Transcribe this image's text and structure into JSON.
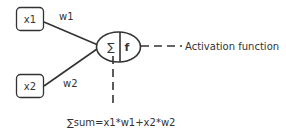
{
  "diagram": {
    "inputs": [
      {
        "label": "x1",
        "weight": "w1"
      },
      {
        "label": "x2",
        "weight": "w2"
      }
    ],
    "neuron": {
      "sum_symbol": "∑",
      "activation_symbol": "f"
    },
    "annotations": {
      "activation": "Activation function",
      "sum_formula": "∑sum=x1*w1+x2*w2"
    },
    "colors": {
      "stroke": "#333333",
      "text": "#333333",
      "background": "#ffffff"
    }
  }
}
